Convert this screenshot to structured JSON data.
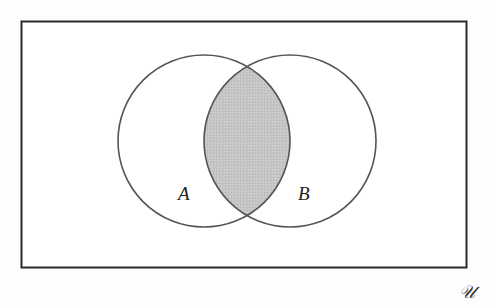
{
  "diagram": {
    "type": "venn",
    "title": "",
    "universe": {
      "label": "U",
      "display_glyph": "𝒰"
    },
    "sets": [
      {
        "label": "A",
        "center": [
          204,
          141
        ],
        "radius": 86
      },
      {
        "label": "B",
        "center": [
          290,
          141
        ],
        "radius": 86
      }
    ],
    "shaded_region": "A ∩ B",
    "colors": {
      "stroke": "#555555",
      "frame": "#2a2a2a",
      "shade": "#c4c4c4",
      "background": "#fdfdfd"
    }
  }
}
